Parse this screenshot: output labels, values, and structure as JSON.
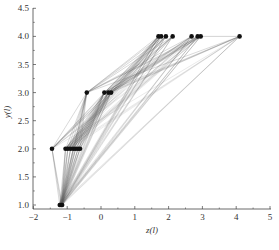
{
  "chart_data": {
    "type": "scatter",
    "title": "",
    "xlabel": "z(l)",
    "ylabel": "y(l)",
    "xlim": [
      -2,
      5
    ],
    "ylim": [
      0.95,
      4.5
    ],
    "xticks": [
      -2,
      -1,
      0,
      1,
      2,
      3,
      4,
      5
    ],
    "xtick_labels": [
      "−2",
      "−1",
      "0",
      "1",
      "2",
      "3",
      "4",
      "5"
    ],
    "yticks": [
      1.0,
      1.5,
      2.0,
      2.5,
      3.0,
      3.5,
      4.0,
      4.5
    ],
    "ytick_labels": [
      "1.0",
      "1.5",
      "2.0",
      "2.5",
      "3.0",
      "3.5",
      "4.0",
      "4.5"
    ],
    "grid": false,
    "legend": null,
    "points": [
      {
        "x": -1.22,
        "y": 1.0
      },
      {
        "x": -1.18,
        "y": 1.0
      },
      {
        "x": -1.15,
        "y": 1.0
      },
      {
        "x": -1.45,
        "y": 2.0
      },
      {
        "x": -1.05,
        "y": 2.0
      },
      {
        "x": -0.98,
        "y": 2.0
      },
      {
        "x": -0.9,
        "y": 2.0
      },
      {
        "x": -0.82,
        "y": 2.0
      },
      {
        "x": -0.75,
        "y": 2.0
      },
      {
        "x": -0.68,
        "y": 2.0
      },
      {
        "x": -0.62,
        "y": 2.0
      },
      {
        "x": -0.42,
        "y": 3.0
      },
      {
        "x": 0.1,
        "y": 3.0
      },
      {
        "x": 0.22,
        "y": 3.0
      },
      {
        "x": 0.3,
        "y": 3.0
      },
      {
        "x": 1.7,
        "y": 4.0
      },
      {
        "x": 1.78,
        "y": 4.0
      },
      {
        "x": 1.92,
        "y": 4.0
      },
      {
        "x": 2.12,
        "y": 4.0
      },
      {
        "x": 2.68,
        "y": 4.0
      },
      {
        "x": 2.86,
        "y": 4.0
      },
      {
        "x": 2.95,
        "y": 4.0
      },
      {
        "x": 4.1,
        "y": 4.0
      }
    ],
    "edges_note": "Gray connecting line segments link points between successive levels (y=1→2, 2→3, 3→4, and some 1→3/1→4/2→4).",
    "caption": ""
  }
}
